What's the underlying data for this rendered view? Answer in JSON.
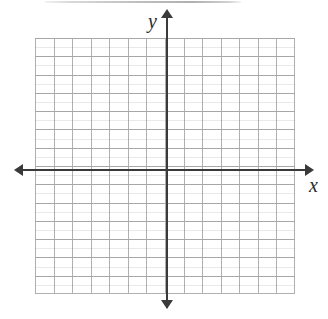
{
  "figure": {
    "kind": "blank-cartesian-coordinate-plane",
    "background_color": "#ffffff"
  },
  "axes": {
    "x_label": "x",
    "y_label": "y",
    "axis_color": "#3a3a3a",
    "grid_color": "#b0b0b0",
    "arrowheads": [
      "left",
      "right",
      "up",
      "down"
    ]
  },
  "chart_data": {
    "type": "scatter",
    "title": "",
    "subtitle": "",
    "xlabel": "x",
    "ylabel": "y",
    "grid": true,
    "legend": "none",
    "annotations": [],
    "tick_labels": {
      "x": [],
      "y": []
    },
    "xlim": [
      -7,
      7
    ],
    "ylim": [
      -7,
      7
    ],
    "grid_step": 1,
    "grid_columns": 14,
    "grid_rows": 14,
    "series": [
      {
        "name": "",
        "x": [],
        "y": []
      }
    ],
    "note": "Empty grid for plotting; no data points, curves, or numeric tick labels are printed."
  }
}
